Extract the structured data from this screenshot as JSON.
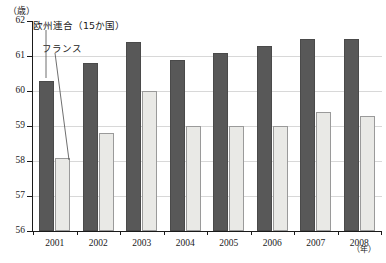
{
  "chart_data": {
    "type": "bar",
    "title": "",
    "subtitle": "",
    "xlabel": "（年）",
    "ylabel": "（歳）",
    "categories": [
      "2001",
      "2002",
      "2003",
      "2004",
      "2005",
      "2006",
      "2007",
      "2008"
    ],
    "series": [
      {
        "name": "欧州連合（15か国）",
        "color": "#585858",
        "values": [
          60.3,
          60.8,
          61.4,
          60.9,
          61.1,
          61.3,
          61.5,
          61.5
        ]
      },
      {
        "name": "フランス",
        "color": "#e9e9e6",
        "values": [
          58.1,
          58.8,
          60.0,
          59.0,
          59.0,
          59.0,
          59.4,
          59.3
        ]
      }
    ],
    "ylim": [
      56,
      62
    ],
    "ytick_labels": [
      "62",
      "61",
      "60",
      "59",
      "58",
      "57",
      "56"
    ],
    "ytick_values": [
      62,
      61,
      60,
      59,
      58,
      57,
      56
    ],
    "grid": true,
    "grid_axis": "y",
    "legend_position": "annotations-inline",
    "annotations": [
      {
        "id": "eu",
        "text": "欧州連合（15か国）",
        "points_to_series": "欧州連合（15か国）",
        "points_to_category": "2001"
      },
      {
        "id": "fr",
        "text": "フランス",
        "points_to_series": "フランス",
        "points_to_category": "2001"
      }
    ]
  },
  "axis": {
    "y_unit": "（歳）",
    "x_unit": "（年）"
  }
}
